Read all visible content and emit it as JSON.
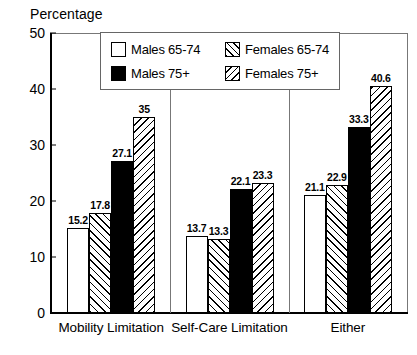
{
  "chart_data": {
    "type": "bar",
    "title": "",
    "ylabel": "Percentage",
    "xlabel": "",
    "ylim": [
      0,
      50
    ],
    "yticks": [
      0,
      10,
      20,
      30,
      40,
      50
    ],
    "ytick_labels": [
      "0",
      "10",
      "20",
      "30",
      "40",
      "50"
    ],
    "grid": false,
    "legend_position": "top-center-inside",
    "categories": [
      "Mobility Limitation",
      "Self-Care Limitation",
      "Either"
    ],
    "series": [
      {
        "name": "Males 65-74",
        "fill": "solid-white",
        "values": [
          15.2,
          13.7,
          21.1
        ],
        "labels": [
          "15.2",
          "13.7",
          "21.1"
        ]
      },
      {
        "name": "Females 65-74",
        "fill": "hatch-fwd",
        "values": [
          17.8,
          13.3,
          22.9
        ],
        "labels": [
          "17.8",
          "13.3",
          "22.9"
        ]
      },
      {
        "name": "Males 75+",
        "fill": "solid-black",
        "values": [
          27.1,
          22.1,
          33.3
        ],
        "labels": [
          "27.1",
          "22.1",
          "33.3"
        ]
      },
      {
        "name": "Females 75+",
        "fill": "hatch-back",
        "values": [
          35,
          23.3,
          40.6
        ],
        "labels": [
          "35",
          "23.3",
          "40.6"
        ]
      }
    ]
  },
  "legend": {
    "items": [
      {
        "label": "Males 65-74",
        "fill": "solid-white"
      },
      {
        "label": "Females 65-74",
        "fill": "hatch-fwd"
      },
      {
        "label": "Males 75+",
        "fill": "solid-black"
      },
      {
        "label": "Females 75+",
        "fill": "hatch-back"
      }
    ]
  },
  "colors": {
    "axis": "#000000",
    "frame": "#666666",
    "bar_outline": "#000000",
    "background": "#ffffff"
  }
}
